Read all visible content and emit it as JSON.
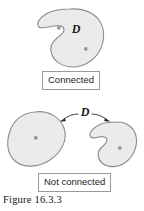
{
  "figure": {
    "caption": "Figure 16.3.3",
    "region_label_top": "D",
    "region_label_bottom": "D",
    "labels": {
      "connected": "Connected",
      "not_connected": "Not connected"
    },
    "colors": {
      "region_fill": "#ebebeb",
      "region_stroke": "#8c8c8c",
      "point_marker": "#8f8f8f",
      "box_border": "#9a9a9a",
      "box_fill": "#ffffff",
      "text": "#1a1a1a",
      "arrow": "#2b2b2b",
      "page_background": "#ffffff"
    },
    "panels": [
      {
        "name": "connected-panel",
        "status": "Connected",
        "region_count": 1,
        "point_count": 2
      },
      {
        "name": "not-connected-panel",
        "status": "Not connected",
        "region_count": 2,
        "point_count": 2
      }
    ]
  }
}
